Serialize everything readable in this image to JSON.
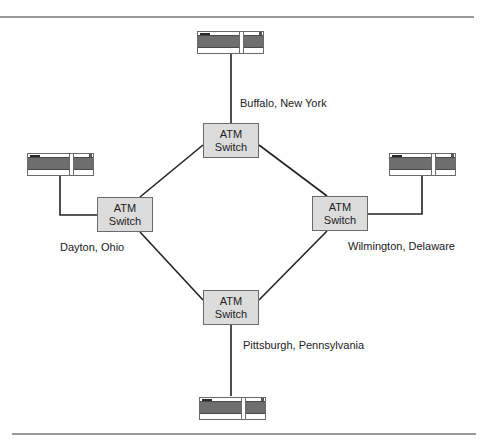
{
  "diagram": {
    "type": "ATM network ring topology",
    "nodes": [
      {
        "id": "buffalo",
        "switch_line1": "ATM",
        "switch_line2": "Switch",
        "location": "Buffalo, New York"
      },
      {
        "id": "dayton",
        "switch_line1": "ATM",
        "switch_line2": "Switch",
        "location": "Dayton, Ohio"
      },
      {
        "id": "wilmington",
        "switch_line1": "ATM",
        "switch_line2": "Switch",
        "location": "Wilmington, Delaware"
      },
      {
        "id": "pittsburgh",
        "switch_line1": "ATM",
        "switch_line2": "Switch",
        "location": "Pittsburgh, Pennsylvania"
      }
    ],
    "devices": [
      {
        "id": "device-buffalo",
        "icon": "server-device-icon",
        "attached_to": "buffalo"
      },
      {
        "id": "device-dayton",
        "icon": "server-device-icon",
        "attached_to": "dayton"
      },
      {
        "id": "device-wilmington",
        "icon": "server-device-icon",
        "attached_to": "wilmington"
      },
      {
        "id": "device-pittsburgh",
        "icon": "server-device-icon",
        "attached_to": "pittsburgh"
      }
    ],
    "links": [
      [
        "buffalo",
        "dayton"
      ],
      [
        "buffalo",
        "wilmington"
      ],
      [
        "dayton",
        "pittsburgh"
      ],
      [
        "wilmington",
        "pittsburgh"
      ]
    ],
    "colors": {
      "switch_fill": "#dcdcdc",
      "device_face": "#6e6e6e",
      "line": "#222222",
      "rule": "#9a9a9a"
    }
  }
}
